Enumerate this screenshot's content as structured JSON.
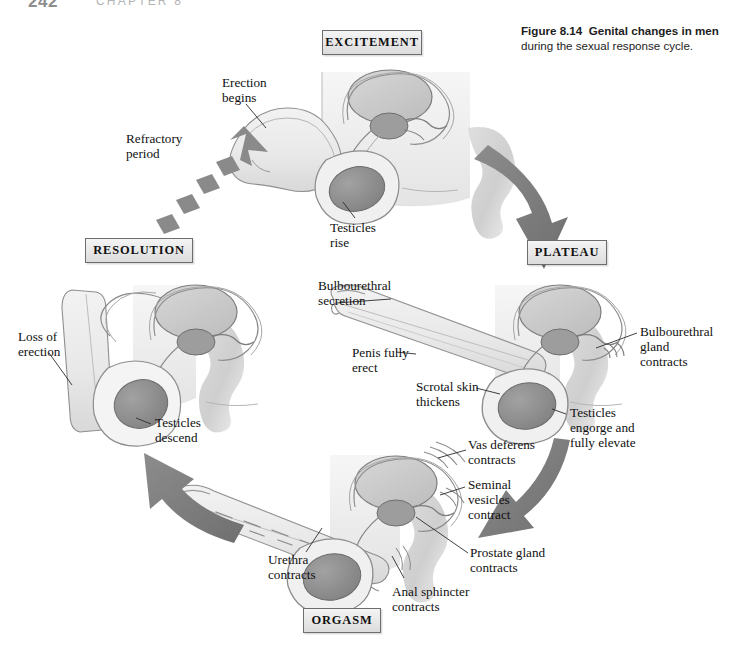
{
  "page": {
    "number": "242",
    "chapter": "CHAPTER 8"
  },
  "caption": {
    "figure_number": "Figure 8.14",
    "title": "Genital changes in men",
    "subtitle": "during the sexual response cycle."
  },
  "phases": [
    {
      "id": "excitement",
      "label": "EXCITEMENT"
    },
    {
      "id": "plateau",
      "label": "PLATEAU"
    },
    {
      "id": "orgasm",
      "label": "ORGASM"
    },
    {
      "id": "resolution",
      "label": "RESOLUTION"
    }
  ],
  "annotations": {
    "excitement": [
      {
        "name": "erection-begins",
        "text": "Erection\nbegins"
      },
      {
        "name": "testicles-rise",
        "text": "Testicles\nrise"
      }
    ],
    "plateau": [
      {
        "name": "bulbourethral-secretion",
        "text": "Bulbourethral\nsecretion"
      },
      {
        "name": "penis-fully-erect",
        "text": "Penis fully\nerect"
      },
      {
        "name": "scrotal-skin-thickens",
        "text": "Scrotal skin\nthickens"
      },
      {
        "name": "bulbourethral-gland-contracts",
        "text": "Bulbourethral\ngland\ncontracts"
      },
      {
        "name": "testicles-engorge",
        "text": "Testicles\nengorge and\nfully elevate"
      }
    ],
    "orgasm": [
      {
        "name": "vas-deferens-contracts",
        "text": "Vas deferens\ncontracts"
      },
      {
        "name": "seminal-vesicles-contract",
        "text": "Seminal\nvesicles\ncontract"
      },
      {
        "name": "prostate-gland-contracts",
        "text": "Prostate gland\ncontracts"
      },
      {
        "name": "anal-sphincter-contracts",
        "text": "Anal sphincter\ncontracts"
      },
      {
        "name": "urethra-contracts",
        "text": "Urethra\ncontracts"
      }
    ],
    "resolution": [
      {
        "name": "loss-of-erection",
        "text": "Loss of\nerection"
      },
      {
        "name": "testicles-descend",
        "text": "Testicles\ndescend"
      }
    ]
  },
  "flow": {
    "refractory_period": "Refractory\nperiod",
    "arrows": [
      {
        "name": "excitement-to-plateau",
        "style": "solid"
      },
      {
        "name": "plateau-to-orgasm",
        "style": "solid"
      },
      {
        "name": "orgasm-to-resolution",
        "style": "solid"
      },
      {
        "name": "resolution-to-excitement",
        "style": "dashed"
      }
    ]
  },
  "colors": {
    "arrow_gray": "#808080",
    "testicle_fill": "#8d8d8d",
    "organ_fill": "#c9c9c9",
    "tissue_fill": "#ececec",
    "outline": "#6f6f6f",
    "box_border": "#6d6d6d"
  }
}
